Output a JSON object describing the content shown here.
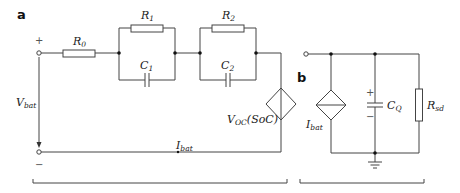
{
  "panels": {
    "a": {
      "label": "a",
      "terminal_plus": "+",
      "terminal_minus": "−",
      "components": {
        "R0": {
          "sym": "R",
          "sub": "0"
        },
        "R1": {
          "sym": "R",
          "sub": "1"
        },
        "C1": {
          "sym": "C",
          "sub": "1"
        },
        "R2": {
          "sym": "R",
          "sub": "2"
        },
        "C2": {
          "sym": "C",
          "sub": "2"
        },
        "source": {
          "sym": "V",
          "sub": "OC",
          "arg": "(SoC)"
        }
      },
      "voltage": {
        "sym": "V",
        "sub": "bat"
      },
      "current": {
        "sym": "I",
        "sub": "bat"
      }
    },
    "b": {
      "label": "b",
      "components": {
        "source": {
          "sym": "I",
          "sub": "bat"
        },
        "capacitor": {
          "sym": "C",
          "sub": "Q"
        },
        "resistor": {
          "sym": "R",
          "sub": "sd"
        }
      },
      "cap_plus": "+",
      "cap_minus": "−"
    }
  }
}
